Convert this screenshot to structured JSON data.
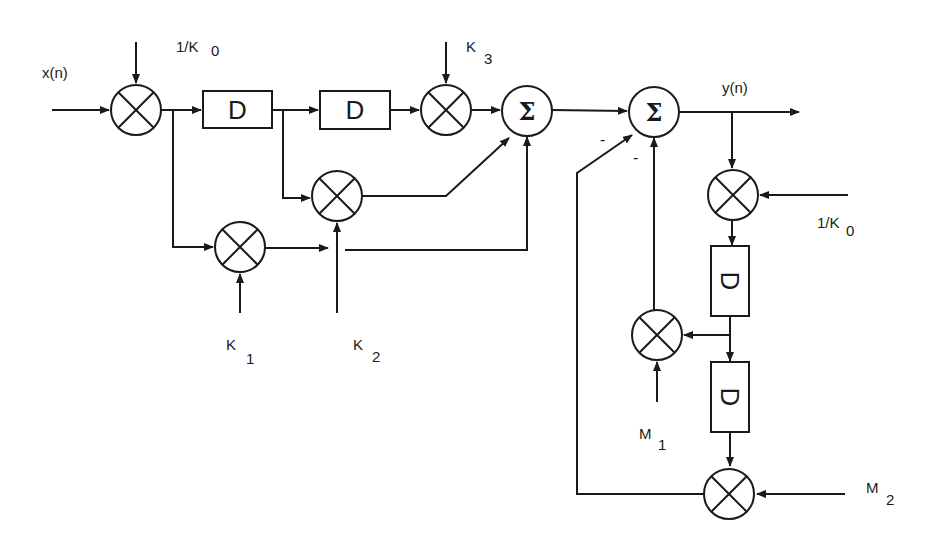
{
  "diagram": {
    "type": "signal-flow block diagram (lattice / IIR filter)",
    "signals": {
      "input": "x(n)",
      "output": "y(n)"
    },
    "coefficients": {
      "k0_top": {
        "main": "1/K",
        "sub": "0"
      },
      "k3": {
        "main": "K",
        "sub": "3"
      },
      "k1": {
        "main": "K",
        "sub": "1"
      },
      "k2": {
        "main": "K",
        "sub": "2"
      },
      "k0_right": {
        "main": "1/K",
        "sub": "0"
      },
      "m1": {
        "main": "M",
        "sub": "1"
      },
      "m2": {
        "main": "M",
        "sub": "2"
      }
    },
    "blocks": {
      "delay_label": "D",
      "sum_label": "Σ",
      "minus_sign": "-"
    },
    "nodes": [
      {
        "id": "mult_k0_in",
        "kind": "multiplier"
      },
      {
        "id": "delay_1",
        "kind": "delay"
      },
      {
        "id": "delay_2",
        "kind": "delay"
      },
      {
        "id": "mult_k3",
        "kind": "multiplier"
      },
      {
        "id": "mult_k2",
        "kind": "multiplier"
      },
      {
        "id": "mult_k1",
        "kind": "multiplier"
      },
      {
        "id": "sum_1",
        "kind": "adder"
      },
      {
        "id": "sum_2",
        "kind": "adder"
      },
      {
        "id": "mult_k0_fb",
        "kind": "multiplier"
      },
      {
        "id": "delay_3",
        "kind": "delay"
      },
      {
        "id": "delay_4",
        "kind": "delay"
      },
      {
        "id": "mult_m1",
        "kind": "multiplier"
      },
      {
        "id": "mult_m2",
        "kind": "multiplier"
      }
    ],
    "colors": {
      "stroke": "#1a1a1a",
      "background": "#ffffff"
    }
  }
}
